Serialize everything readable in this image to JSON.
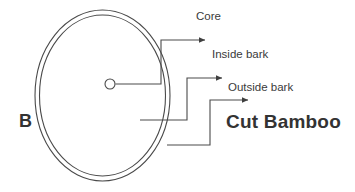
{
  "diagram": {
    "background_color": "#ffffff",
    "stroke_color": "#4a4a4a",
    "text_color": "#3a3a3a",
    "panel_letter": "B",
    "labels": {
      "core": "Core",
      "inside_bark": "Inside bark",
      "outside_bark": "Outside bark",
      "cut_bamboo": "Cut Bamboo"
    },
    "shapes": {
      "outer_circle": {
        "cx": 102.5,
        "cy": 95.5,
        "rx": 67.5,
        "ry": 85.5
      },
      "inner_circle": {
        "cx": 102.5,
        "cy": 95.5,
        "rx": 63.0,
        "ry": 80.5
      },
      "core_circle": {
        "cx": 110,
        "cy": 84,
        "r": 5
      }
    },
    "leaders": {
      "core": "from core circle right to x=161, up to y=40, right to arrow at x=207",
      "inside_bark": "from x=140 y=120 right to x=187, up to y=78, right to arrow at x=224",
      "outside_bark": "from x=167 y=145 right to x=210, up to y=100, right to arrow at x=250"
    }
  }
}
